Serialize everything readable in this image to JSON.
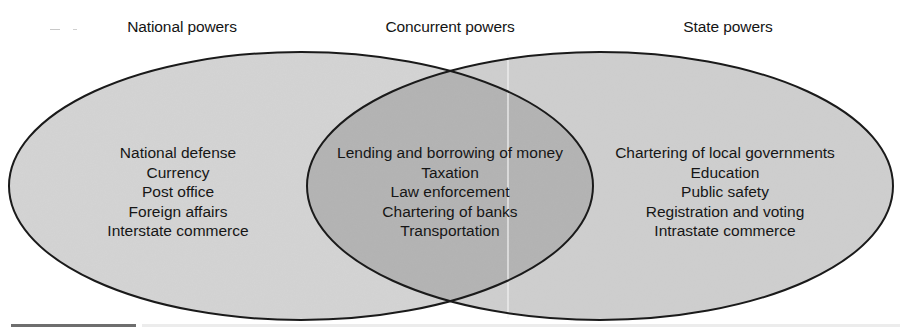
{
  "diagram": {
    "type": "venn",
    "title": "",
    "colors": {
      "background": "#ffffff",
      "outer_fill": "#d2d2d2",
      "overlap_fill": "#b4b4b4",
      "outline": "#1a1a1a",
      "text": "#161616"
    },
    "sets": [
      {
        "id": "national",
        "heading": "National powers",
        "items": [
          "National defense",
          "Currency",
          "Post office",
          "Foreign affairs",
          "Interstate commerce"
        ]
      },
      {
        "id": "concurrent",
        "heading": "Concurrent powers",
        "items": [
          "Lending and borrowing of money",
          "Taxation",
          "Law enforcement",
          "Chartering of banks",
          "Transportation"
        ]
      },
      {
        "id": "state",
        "heading": "State powers",
        "items": [
          "Chartering of local governments",
          "Education",
          "Public safety",
          "Registration and voting",
          "Intrastate commerce"
        ]
      }
    ]
  }
}
